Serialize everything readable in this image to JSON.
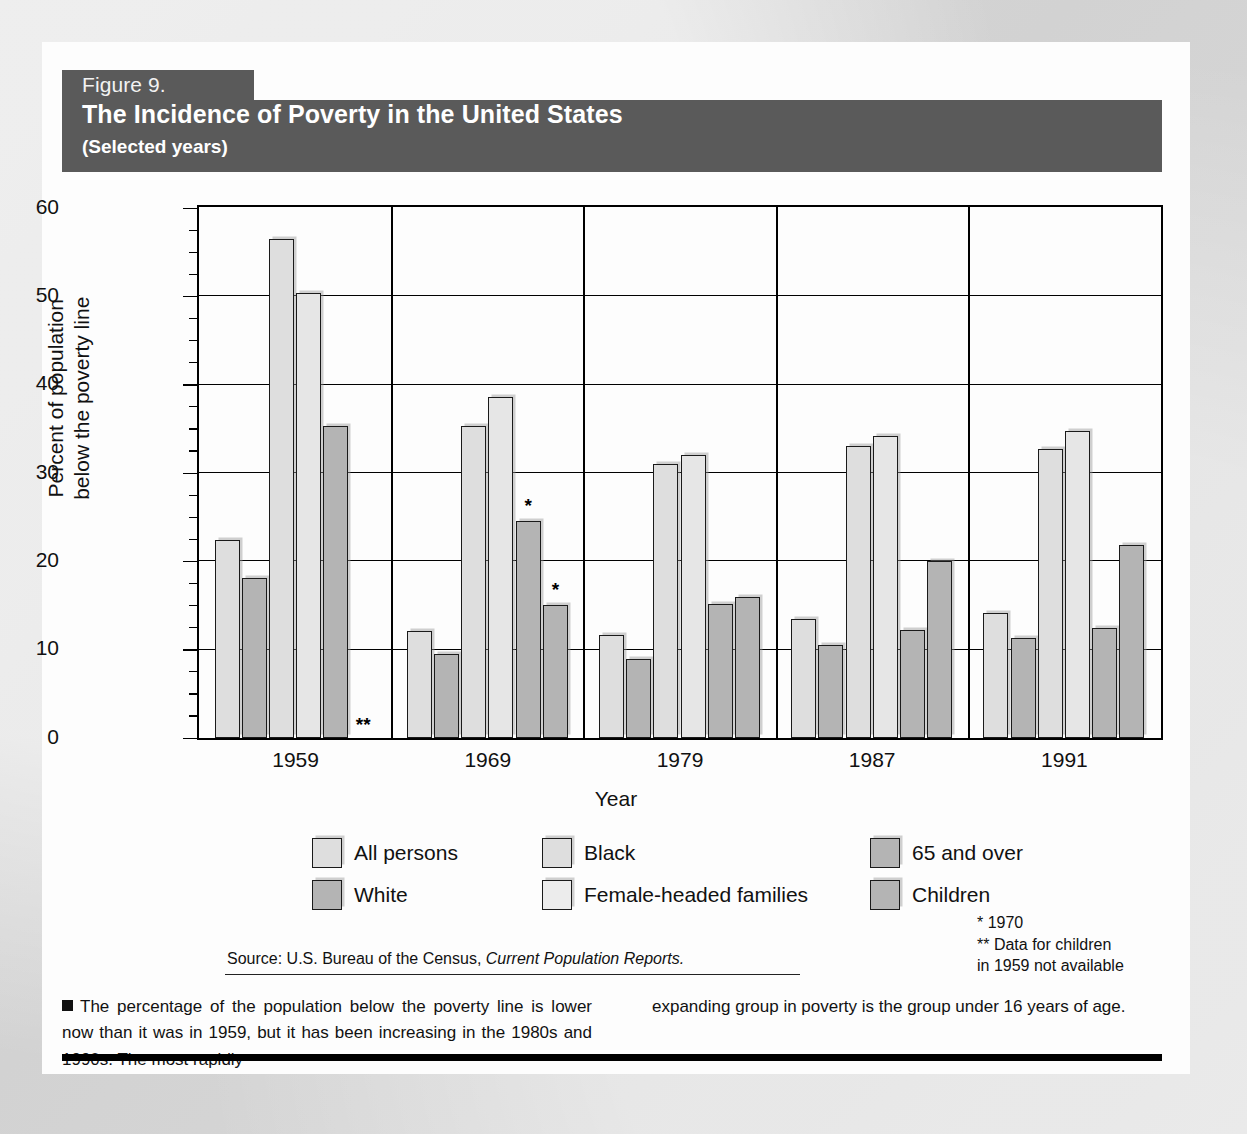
{
  "figure": {
    "number_label": "Figure 9.",
    "title": "The Incidence of Poverty in the United States",
    "subtitle": "(Selected years)",
    "band_color": "#5a5a5a"
  },
  "axes": {
    "ylabel_line1": "Percent of population",
    "ylabel_line2": "below the poverty line",
    "xlabel": "Year",
    "yticks": [
      "0",
      "10",
      "20",
      "30",
      "40",
      "50",
      "60"
    ]
  },
  "legend": {
    "items": [
      {
        "label": "All persons",
        "swatch": "light"
      },
      {
        "label": "White",
        "swatch": "mid"
      },
      {
        "label": "Black",
        "swatch": "light"
      },
      {
        "label": "Female-headed families",
        "swatch": "pale"
      },
      {
        "label": "65 and over",
        "swatch": "mid"
      },
      {
        "label": "Children",
        "swatch": "mid"
      }
    ]
  },
  "footnotes": {
    "line1": "* 1970",
    "line2": "** Data for children",
    "line3": "in 1959 not available"
  },
  "source": {
    "prefix": "Source: U.S. Bureau of the Census, ",
    "italic": "Current Population Reports."
  },
  "caption": {
    "left": "The percentage of the population below the poverty line is lower now than it was in 1959, but it has been increasing in the 1980s and 1990s. The most rapidly",
    "right": "expanding group in poverty is the group under 16 years of age."
  },
  "chart_data": {
    "type": "bar",
    "title": "The Incidence of Poverty in the United States",
    "subtitle": "(Selected years)",
    "xlabel": "Year",
    "ylabel": "Percent of population below the poverty line",
    "ylim": [
      0,
      60
    ],
    "ytick_step": 10,
    "yminor_step": 2.5,
    "grid": true,
    "legend_position": "below",
    "categories": [
      "1959",
      "1969",
      "1979",
      "1987",
      "1991"
    ],
    "series": [
      {
        "name": "All persons",
        "swatch": "light",
        "values": [
          22.4,
          12.1,
          11.7,
          13.5,
          14.2
        ]
      },
      {
        "name": "White",
        "swatch": "mid",
        "values": [
          18.1,
          9.5,
          9.0,
          10.5,
          11.3
        ]
      },
      {
        "name": "Black",
        "swatch": "light",
        "values": [
          56.5,
          35.3,
          31.0,
          33.1,
          32.7
        ]
      },
      {
        "name": "Female-headed families",
        "swatch": "pale",
        "values": [
          50.4,
          38.6,
          32.0,
          34.2,
          34.7
        ]
      },
      {
        "name": "65 and over",
        "swatch": "mid",
        "values": [
          35.3,
          24.6,
          15.2,
          12.2,
          12.4
        ],
        "notes": [
          null,
          "*",
          null,
          null,
          null
        ]
      },
      {
        "name": "Children",
        "swatch": "mid",
        "values": [
          null,
          15.1,
          16.0,
          20.0,
          21.8
        ],
        "notes": [
          null,
          "*",
          null,
          null,
          null
        ]
      }
    ],
    "annotations": [
      {
        "text": "**",
        "category": "1959",
        "series": "Children",
        "meaning": "Data for children in 1959 not available"
      },
      {
        "text": "*",
        "category": "1969",
        "series": "65 and over",
        "meaning": "1970"
      },
      {
        "text": "*",
        "category": "1969",
        "series": "Children",
        "meaning": "1970"
      }
    ]
  }
}
